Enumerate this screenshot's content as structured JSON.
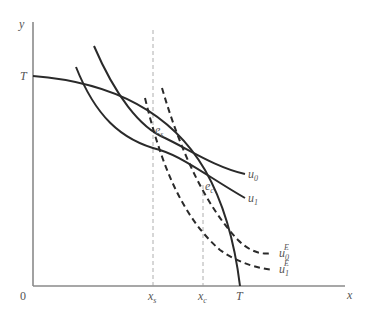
{
  "diagram": {
    "axes": {
      "x_label": "x",
      "y_label": "y",
      "origin_label": "0"
    },
    "intercepts": {
      "y_intercept_label": "T",
      "x_intercept_label": "T"
    },
    "x_markers": [
      {
        "label": "x",
        "subscript": "s"
      },
      {
        "label": "x",
        "subscript": "c"
      }
    ],
    "points": [
      {
        "label": "e",
        "subscript": "s"
      },
      {
        "label": "e",
        "subscript": "c"
      }
    ],
    "curves": [
      {
        "name": "transformation-frontier",
        "label": "",
        "style": "solid"
      },
      {
        "name": "indifference-u0",
        "label": "u",
        "subscript": "0",
        "style": "solid"
      },
      {
        "name": "indifference-u1",
        "label": "u",
        "subscript": "1",
        "style": "solid"
      },
      {
        "name": "indifference-u0E",
        "label": "u",
        "subscript": "0",
        "superscript": "E",
        "style": "dashed"
      },
      {
        "name": "indifference-u1E",
        "label": "u",
        "subscript": "1",
        "superscript": "E",
        "style": "dashed"
      }
    ]
  }
}
